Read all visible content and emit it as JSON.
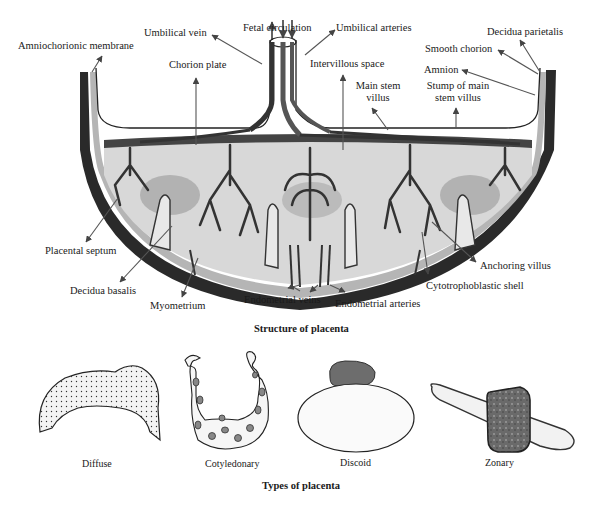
{
  "structure": {
    "caption": "Structure of placenta",
    "labels": {
      "amniochorionic_membrane": "Amniochorionic membrane",
      "umbilical_vein": "Umbilical vein",
      "fetal_circulation": "Fetal circulation",
      "umbilical_arteries": "Umbilical arteries",
      "decidua_parietalis": "Decidua parietalis",
      "smooth_chorion": "Smooth chorion",
      "chorion_plate": "Chorion plate",
      "intervillous_space": "Intervillous space",
      "amnion": "Amnion",
      "main_stem_villus_line1": "Main stem",
      "main_stem_villus_line2": "villus",
      "stump_line1": "Stump of main",
      "stump_line2": "stem villus",
      "placental_septum": "Placental septum",
      "decidua_basalis": "Decidua basalis",
      "myometrium": "Myometrium",
      "endometrial_veins": "Endometrial veins",
      "endometrial_arteries": "Endometrial arteries",
      "cytotrophoblastic_shell": "Cytotrophoblastic shell",
      "anchoring_villus": "Anchoring villus"
    }
  },
  "types": {
    "caption": "Types of placenta",
    "items": [
      {
        "name": "Diffuse"
      },
      {
        "name": "Cotyledonary"
      },
      {
        "name": "Discoid"
      },
      {
        "name": "Zonary"
      }
    ]
  }
}
